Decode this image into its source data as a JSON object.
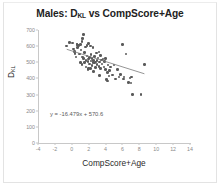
{
  "chart_data": {
    "type": "scatter",
    "title": "Males: DKL vs CompScore+Age",
    "title_main": "Males: D",
    "title_sub": "KL",
    "title_rest": " vs CompScore+Age",
    "xlabel": "CompScore+Age",
    "ylabel_main": "D",
    "ylabel_sub": "KL",
    "ylabel": "DKL",
    "xlim": [
      -4,
      14
    ],
    "ylim": [
      0,
      700
    ],
    "xticks": [
      -4,
      -2,
      0,
      2,
      4,
      6,
      8,
      10,
      12,
      14
    ],
    "yticks": [
      0,
      100,
      200,
      300,
      400,
      500,
      600,
      700
    ],
    "grid": false,
    "legend": "none",
    "marker_color": "#5a5a5a",
    "trendline_color": "#7a7a7a",
    "annotation": "y = -16.479x + 570.6",
    "trendline": {
      "slope": -16.479,
      "intercept": 570.6,
      "x_start": -0.6,
      "x_end": 8.6
    },
    "x": [
      -0.6,
      -0.3,
      0.1,
      0.2,
      0.3,
      0.4,
      0.5,
      0.6,
      0.7,
      0.8,
      0.9,
      1.0,
      1.0,
      1.1,
      1.2,
      1.2,
      1.3,
      1.4,
      1.4,
      1.5,
      1.5,
      1.6,
      1.7,
      1.7,
      1.8,
      1.8,
      1.9,
      1.9,
      2.0,
      2.0,
      2.1,
      2.1,
      2.2,
      2.2,
      2.3,
      2.3,
      2.4,
      2.4,
      2.5,
      2.5,
      2.6,
      2.6,
      2.7,
      2.8,
      2.8,
      2.9,
      3.0,
      3.0,
      3.1,
      3.2,
      3.2,
      3.3,
      3.4,
      3.4,
      3.5,
      3.6,
      3.7,
      3.8,
      3.9,
      4.0,
      4.0,
      4.1,
      4.2,
      4.3,
      4.4,
      4.5,
      4.6,
      4.8,
      5.0,
      5.2,
      5.4,
      5.6,
      5.8,
      6.0,
      6.1,
      6.2,
      6.4,
      6.7,
      6.9,
      7.0,
      7.1,
      7.2,
      8.2,
      8.6,
      1.3,
      2.7,
      3.3,
      4.2,
      0.6,
      2.0
    ],
    "y": [
      601,
      623,
      620,
      582,
      568,
      556,
      532,
      610,
      592,
      604,
      551,
      612,
      500,
      575,
      627,
      486,
      533,
      672,
      523,
      560,
      498,
      594,
      512,
      470,
      540,
      605,
      505,
      455,
      617,
      520,
      489,
      530,
      600,
      463,
      508,
      548,
      525,
      480,
      497,
      592,
      512,
      443,
      535,
      501,
      467,
      557,
      510,
      488,
      527,
      564,
      474,
      503,
      541,
      462,
      513,
      490,
      520,
      472,
      505,
      456,
      522,
      394,
      438,
      484,
      415,
      450,
      471,
      420,
      482,
      397,
      455,
      410,
      425,
      612,
      396,
      408,
      552,
      376,
      403,
      372,
      410,
      299,
      299,
      487,
      648,
      495,
      418,
      383,
      612,
      462
    ]
  }
}
